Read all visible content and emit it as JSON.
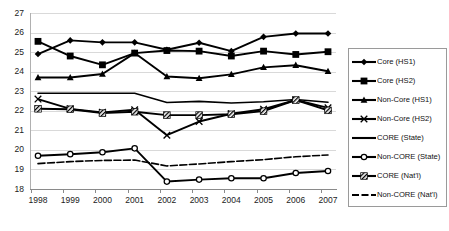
{
  "chart_data": {
    "type": "line",
    "title": "",
    "xlabel": "",
    "ylabel": "",
    "x": [
      1998,
      1999,
      2000,
      2001,
      2002,
      2003,
      2004,
      2005,
      2006,
      2007
    ],
    "xticklabels": [
      "1998",
      "1999",
      "2000",
      "2001",
      "2002",
      "2003",
      "2004",
      "2005",
      "2006",
      "2007"
    ],
    "ylim": [
      18,
      27
    ],
    "yticks": [
      18,
      19,
      20,
      21,
      22,
      23,
      24,
      25,
      26,
      27
    ],
    "yticklabels": [
      "18",
      "19",
      "20",
      "21",
      "22",
      "23",
      "24",
      "25",
      "26",
      "27"
    ],
    "grid": "horizontal",
    "legend_position": "right-outside",
    "series": [
      {
        "name": "Core (HS1)",
        "marker": "filled-diamond",
        "line": "solid",
        "color": "#000000",
        "values": [
          24.9,
          25.6,
          25.5,
          25.5,
          25.12,
          25.48,
          25.05,
          25.78,
          25.95,
          25.95
        ]
      },
      {
        "name": "Core (HS2)",
        "marker": "filled-square",
        "line": "solid",
        "color": "#000000",
        "values": [
          25.55,
          24.8,
          24.35,
          24.95,
          25.08,
          25.05,
          24.8,
          25.05,
          24.88,
          25.02
        ]
      },
      {
        "name": "Non-Core (HS1)",
        "marker": "filled-triangle",
        "line": "solid",
        "color": "#000000",
        "values": [
          23.7,
          23.7,
          23.88,
          24.95,
          23.75,
          23.66,
          23.86,
          24.22,
          24.33,
          24.02
        ]
      },
      {
        "name": "Non-Core (HS2)",
        "marker": "cross-x",
        "line": "solid",
        "color": "#000000",
        "values": [
          22.6,
          22.1,
          21.92,
          22.05,
          20.75,
          21.45,
          21.85,
          22.08,
          22.55,
          22.15
        ]
      },
      {
        "name": "CORE (State)",
        "marker": "none",
        "line": "solid",
        "color": "#000000",
        "values": [
          22.9,
          22.9,
          22.9,
          22.9,
          22.42,
          22.48,
          22.4,
          22.46,
          22.58,
          22.44
        ]
      },
      {
        "name": "Non-CORE (State)",
        "marker": "open-circle",
        "line": "solid",
        "color": "#000000",
        "values": [
          19.7,
          19.78,
          19.88,
          20.08,
          18.38,
          18.48,
          18.55,
          18.55,
          18.82,
          18.92
        ]
      },
      {
        "name": "CORE (Nat'l)",
        "marker": "hatched",
        "line": "solid",
        "color": "#000000",
        "values": [
          22.1,
          22.08,
          21.88,
          21.95,
          21.78,
          21.78,
          21.82,
          21.98,
          22.55,
          22.02
        ]
      },
      {
        "name": "Non-CORE (Nat'l)",
        "marker": "none",
        "line": "dashed",
        "color": "#000000",
        "values": [
          19.3,
          19.4,
          19.46,
          19.48,
          19.18,
          19.28,
          19.4,
          19.5,
          19.65,
          19.74
        ]
      }
    ]
  },
  "legend": {
    "items": [
      {
        "label": "Core (HS1)",
        "marker": "filled-diamond"
      },
      {
        "label": "Core (HS2)",
        "marker": "filled-square"
      },
      {
        "label": "Non-Core (HS1)",
        "marker": "filled-triangle"
      },
      {
        "label": "Non-Core (HS2)",
        "marker": "cross-x"
      },
      {
        "label": "CORE (State)",
        "marker": "none"
      },
      {
        "label": "Non-CORE (State)",
        "marker": "open-circle"
      },
      {
        "label": "CORE (Nat'l)",
        "marker": "hatched"
      },
      {
        "label": "Non-CORE (Nat'l)",
        "marker": "dashed-line"
      }
    ]
  }
}
